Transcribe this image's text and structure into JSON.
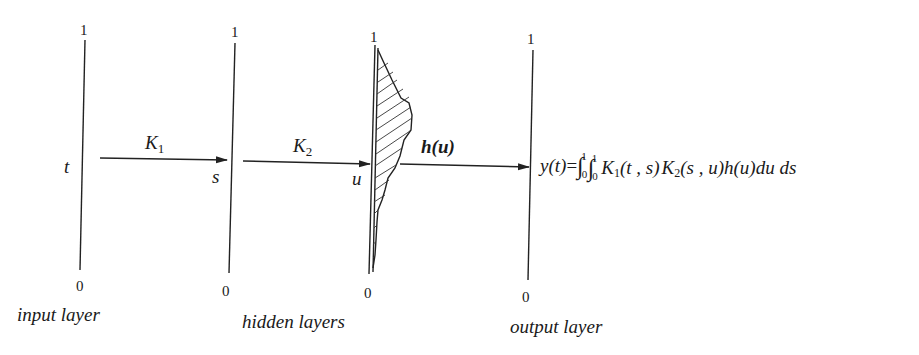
{
  "diagram": {
    "layers": [
      {
        "id": "input",
        "caption": "input layer",
        "variable": "t",
        "top_label": "1",
        "bottom_label": "0"
      },
      {
        "id": "hidden-1",
        "variable": "s",
        "top_label": "1",
        "bottom_label": "0"
      },
      {
        "id": "hidden-2",
        "variable": "u",
        "top_label": "1",
        "bottom_label": "0"
      },
      {
        "id": "output",
        "caption": "output layer",
        "top_label": "1",
        "bottom_label": "0"
      }
    ],
    "hidden_caption": "hidden layers",
    "arrows": [
      {
        "from": "input",
        "to": "hidden-1",
        "label_main": "K",
        "label_sub": "1"
      },
      {
        "from": "hidden-1",
        "to": "hidden-2",
        "label_main": "K",
        "label_sub": "2"
      },
      {
        "from": "hidden-2",
        "to": "output",
        "label": "h(u)"
      }
    ],
    "weight_function": {
      "name": "h(u)",
      "style": "hatched profile along hidden layer u"
    },
    "equation": {
      "lhs": "y(t)",
      "equals": "=",
      "integral_1": {
        "symbol": "∫",
        "upper": "1",
        "lower": "0"
      },
      "integral_2": {
        "symbol": "∫",
        "upper": "1",
        "lower": "0"
      },
      "k1": "K",
      "k1_sub": "1",
      "k1_args": "(t , s)",
      "k2": "K",
      "k2_sub": "2",
      "k2_args": "(s , u)",
      "h": "h(u)",
      "differentials": "du ds",
      "full_text": "y(t)=∫₀¹∫₀¹ K₁(t,s) K₂(s,u) h(u) du ds"
    }
  }
}
